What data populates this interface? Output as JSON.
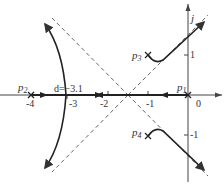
{
  "diagram": {
    "type": "root-locus",
    "axes": {
      "real_axis": {
        "label": "",
        "tick_labels": [
          "-4",
          "-3",
          "-2",
          "-1",
          "0"
        ]
      },
      "imag_axis": {
        "label": "j",
        "tick_labels": [
          "1",
          "-1"
        ]
      }
    },
    "poles": [
      {
        "name": "p",
        "sub": "1",
        "position": "0"
      },
      {
        "name": "p",
        "sub": "2",
        "position": "-4"
      },
      {
        "name": "p",
        "sub": "3",
        "position": "-1+j1"
      },
      {
        "name": "p",
        "sub": "4",
        "position": "-1-j1"
      }
    ],
    "breakaway": {
      "label": "d=−3.1"
    },
    "asymptote_center": "-1.5",
    "colors": {
      "locus": "#333333",
      "axis": "#444444",
      "asymptote": "#555555"
    }
  }
}
